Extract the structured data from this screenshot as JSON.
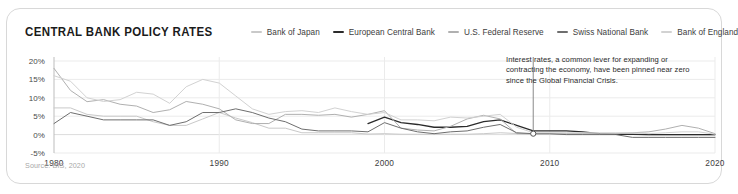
{
  "card": {
    "title": "CENTRAL BANK POLICY RATES",
    "source": "Source: BIS, 2020",
    "annotation": "Interest rates, a common lever for expanding or contracting the economy, have been pinned near zero since the Global Financial Crisis."
  },
  "colors": {
    "boj": "#c9c9c9",
    "ecb": "#2b2b2b",
    "fed": "#b0b0b0",
    "snb": "#6e6e6e",
    "boe": "#d2d2d2",
    "grid": "#ebebeb",
    "axis": "#bdbdbd",
    "text": "#3d3d3d",
    "muted": "#a8a8a8",
    "card_border": "#d8d8d8"
  },
  "chart_data": {
    "type": "line",
    "title": "CENTRAL BANK POLICY RATES",
    "xlabel": "",
    "ylabel": "",
    "xlim": [
      1980,
      2020
    ],
    "ylim": [
      -5,
      20
    ],
    "ytick_labels": [
      "20%",
      "15%",
      "10%",
      "5%",
      "0%",
      "-5%"
    ],
    "yticks": [
      20,
      15,
      10,
      5,
      0,
      -5
    ],
    "xticks": [
      1980,
      1990,
      2000,
      2010,
      2020
    ],
    "xtick_labels": [
      "1980",
      "1990",
      "2000",
      "2010",
      "2020"
    ],
    "grid": true,
    "legend_position": "top",
    "annotations": [
      {
        "text": "Interest rates, a common lever for expanding or contracting the economy, have been pinned near zero since the Global Financial Crisis.",
        "marker_x": 2009,
        "marker_y": 0.25
      }
    ],
    "series": [
      {
        "name": "Bank of Japan",
        "color": "#c9c9c9",
        "x": [
          1980,
          1981,
          1982,
          1983,
          1984,
          1985,
          1986,
          1987,
          1988,
          1989,
          1990,
          1991,
          1992,
          1993,
          1994,
          1995,
          1996,
          1997,
          1998,
          1999,
          2000,
          2001,
          2002,
          2003,
          2004,
          2005,
          2006,
          2007,
          2008,
          2009,
          2010,
          2011,
          2012,
          2013,
          2014,
          2015,
          2016,
          2017,
          2018,
          2019,
          2020
        ],
        "values": [
          7.25,
          7.25,
          5.5,
          5.0,
          5.0,
          5.0,
          3.5,
          2.5,
          2.5,
          4.25,
          6.0,
          4.5,
          3.25,
          1.75,
          1.75,
          0.5,
          0.5,
          0.5,
          0.5,
          0.15,
          0.25,
          0.1,
          0.1,
          0.1,
          0.1,
          0.1,
          0.25,
          0.5,
          0.3,
          0.1,
          0.1,
          0.1,
          0.1,
          0.1,
          0.1,
          0.1,
          -0.1,
          -0.1,
          -0.1,
          -0.1,
          -0.1
        ]
      },
      {
        "name": "European Central Bank",
        "color": "#2b2b2b",
        "x": [
          1999,
          2000,
          2001,
          2002,
          2003,
          2004,
          2005,
          2006,
          2007,
          2008,
          2009,
          2010,
          2011,
          2012,
          2013,
          2014,
          2015,
          2016,
          2017,
          2018,
          2019,
          2020
        ],
        "values": [
          3.0,
          4.75,
          3.25,
          2.75,
          2.0,
          2.0,
          2.25,
          3.5,
          4.0,
          2.5,
          1.0,
          1.0,
          1.0,
          0.75,
          0.25,
          0.05,
          0.05,
          0.0,
          0.0,
          0.0,
          0.0,
          0.0
        ]
      },
      {
        "name": "U.S. Federal Reserve",
        "color": "#b0b0b0",
        "x": [
          1980,
          1981,
          1982,
          1983,
          1984,
          1985,
          1986,
          1987,
          1988,
          1989,
          1990,
          1991,
          1992,
          1993,
          1994,
          1995,
          1996,
          1997,
          1998,
          1999,
          2000,
          2001,
          2002,
          2003,
          2004,
          2005,
          2006,
          2007,
          2008,
          2009,
          2010,
          2011,
          2012,
          2013,
          2014,
          2015,
          2016,
          2017,
          2018,
          2019,
          2020
        ],
        "values": [
          18.0,
          12.0,
          8.95,
          9.5,
          8.25,
          7.75,
          6.0,
          6.75,
          9.0,
          8.25,
          7.0,
          4.0,
          3.0,
          3.0,
          5.5,
          5.5,
          5.25,
          5.5,
          4.75,
          5.5,
          6.5,
          1.75,
          1.25,
          1.0,
          2.25,
          4.25,
          5.25,
          4.25,
          0.25,
          0.25,
          0.25,
          0.25,
          0.25,
          0.25,
          0.25,
          0.5,
          0.75,
          1.5,
          2.5,
          1.75,
          0.25
        ]
      },
      {
        "name": "Swiss National Bank",
        "color": "#6e6e6e",
        "x": [
          1980,
          1981,
          1982,
          1983,
          1984,
          1985,
          1986,
          1987,
          1988,
          1989,
          1990,
          1991,
          1992,
          1993,
          1994,
          1995,
          1996,
          1997,
          1998,
          1999,
          2000,
          2001,
          2002,
          2003,
          2004,
          2005,
          2006,
          2007,
          2008,
          2009,
          2010,
          2011,
          2012,
          2013,
          2014,
          2015,
          2016,
          2017,
          2018,
          2019,
          2020
        ],
        "values": [
          3.0,
          6.0,
          5.0,
          4.0,
          4.0,
          4.0,
          4.0,
          2.5,
          3.5,
          6.0,
          6.0,
          7.0,
          6.0,
          4.5,
          3.5,
          1.5,
          1.0,
          1.0,
          1.0,
          0.75,
          3.25,
          1.75,
          0.75,
          0.25,
          0.75,
          1.0,
          2.0,
          2.75,
          0.5,
          0.25,
          0.25,
          0.0,
          0.0,
          0.0,
          0.0,
          -0.75,
          -0.75,
          -0.75,
          -0.75,
          -0.75,
          -0.75
        ]
      },
      {
        "name": "Bank of England",
        "color": "#d2d2d2",
        "x": [
          1980,
          1981,
          1982,
          1983,
          1984,
          1985,
          1986,
          1987,
          1988,
          1989,
          1990,
          1991,
          1992,
          1993,
          1994,
          1995,
          1996,
          1997,
          1998,
          1999,
          2000,
          2001,
          2002,
          2003,
          2004,
          2005,
          2006,
          2007,
          2008,
          2009,
          2010,
          2011,
          2012,
          2013,
          2014,
          2015,
          2016,
          2017,
          2018,
          2019,
          2020
        ],
        "values": [
          16.0,
          14.5,
          10.0,
          9.0,
          9.5,
          11.5,
          11.0,
          8.5,
          13.0,
          15.0,
          14.0,
          10.5,
          7.0,
          5.5,
          6.25,
          6.5,
          6.0,
          7.25,
          6.25,
          5.5,
          6.0,
          4.0,
          4.0,
          3.75,
          4.75,
          4.5,
          5.0,
          5.5,
          2.0,
          0.5,
          0.5,
          0.5,
          0.5,
          0.5,
          0.5,
          0.5,
          0.25,
          0.5,
          0.75,
          0.75,
          0.1
        ]
      }
    ]
  },
  "legend": [
    {
      "label": "Bank of Japan",
      "key": "boj"
    },
    {
      "label": "European Central Bank",
      "key": "ecb"
    },
    {
      "label": "U.S. Federal Reserve",
      "key": "fed"
    },
    {
      "label": "Swiss National Bank",
      "key": "snb"
    },
    {
      "label": "Bank of England",
      "key": "boe"
    }
  ]
}
